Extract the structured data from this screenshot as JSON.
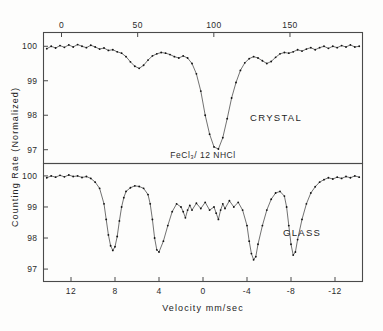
{
  "figure": {
    "ylabel": "Counting Rate (Normalized)",
    "xlabel_bottom": "Velocity  mm/sec",
    "center_annotation": "FeCl₃/ 12 NHCl",
    "ink_color": "#1a1a1a",
    "frame_color": "#4a4a4a",
    "background": "#fdfdfc"
  },
  "axes": {
    "top_channel_ticks": [
      "0",
      "50",
      "100",
      "150",
      "200"
    ],
    "top_channel_values": [
      0,
      50,
      100,
      150,
      200
    ],
    "bottom_velocity_ticks": [
      "12",
      "8",
      "4",
      "0",
      "-4",
      "-8",
      "-12"
    ],
    "bottom_velocity_values": [
      12,
      8,
      4,
      0,
      -4,
      -8,
      -12
    ],
    "y_ticks_upper": [
      "100",
      "99",
      "98",
      "97"
    ],
    "y_ticks_lower": [
      "100",
      "99",
      "98",
      "97"
    ],
    "y_values": [
      100,
      99,
      98,
      97
    ]
  },
  "panels": [
    {
      "id": "upper",
      "label": "CRYSTAL"
    },
    {
      "id": "lower",
      "label": "GLASS"
    }
  ],
  "chart_data": {
    "type": "line",
    "title": "FeCl₃/ 12 NHCl",
    "xlabel": "Velocity  mm/sec",
    "ylabel": "Counting Rate (Normalized)",
    "grid": false,
    "legend": "none",
    "top_axis_label": "Channel number",
    "top_axis_range": [
      0,
      200
    ],
    "xlim": [
      14.5,
      -14.5
    ],
    "ylim": [
      96.6,
      100.4
    ],
    "series": [
      {
        "name": "CRYSTAL",
        "panel": "upper",
        "absorption_minima_velocity": [
          5.6,
          2.4,
          0.0,
          -2.6,
          -5.8
        ],
        "deepest_minimum": {
          "velocity": 0.0,
          "counting_rate": 97.0
        },
        "x": [
          14.2,
          13.8,
          13.4,
          13.0,
          12.6,
          12.2,
          11.8,
          11.4,
          11.0,
          10.6,
          10.2,
          9.8,
          9.4,
          9.0,
          8.6,
          8.2,
          7.8,
          7.4,
          7.0,
          6.6,
          6.2,
          5.8,
          5.4,
          5.0,
          4.6,
          4.2,
          3.8,
          3.4,
          3.0,
          2.6,
          2.2,
          1.8,
          1.4,
          1.0,
          0.6,
          0.2,
          -0.2,
          -0.6,
          -1.0,
          -1.4,
          -1.8,
          -2.2,
          -2.6,
          -3.0,
          -3.4,
          -3.8,
          -4.2,
          -4.6,
          -5.0,
          -5.4,
          -5.8,
          -6.2,
          -6.6,
          -7.0,
          -7.4,
          -7.8,
          -8.2,
          -8.6,
          -9.0,
          -9.4,
          -9.8,
          -10.2,
          -10.6,
          -11.0,
          -11.4,
          -11.8,
          -12.2,
          -12.6,
          -13.0,
          -13.4,
          -13.8,
          -14.2
        ],
        "y": [
          99.93,
          100.0,
          99.95,
          100.02,
          99.97,
          100.04,
          99.98,
          100.05,
          100.0,
          99.96,
          100.03,
          99.98,
          99.92,
          99.95,
          99.88,
          99.9,
          99.84,
          99.8,
          99.7,
          99.55,
          99.42,
          99.36,
          99.45,
          99.6,
          99.72,
          99.78,
          99.82,
          99.8,
          99.76,
          99.7,
          99.66,
          99.72,
          99.66,
          99.5,
          99.2,
          98.7,
          98.0,
          97.45,
          97.08,
          97.02,
          97.35,
          97.9,
          98.5,
          98.95,
          99.3,
          99.52,
          99.64,
          99.7,
          99.66,
          99.58,
          99.5,
          99.56,
          99.68,
          99.78,
          99.82,
          99.8,
          99.84,
          99.9,
          99.86,
          99.92,
          99.96,
          99.9,
          99.96,
          100.0,
          99.94,
          100.0,
          99.96,
          100.02,
          99.98,
          100.04,
          99.98,
          100.0
        ]
      },
      {
        "name": "GLASS",
        "panel": "lower",
        "absorption_minima_velocity": [
          8.0,
          4.6,
          1.5,
          -1.5,
          -4.6,
          -8.0
        ],
        "deepest_minimum": {
          "velocity": -4.6,
          "counting_rate": 97.25
        },
        "x": [
          14.2,
          13.8,
          13.4,
          13.0,
          12.6,
          12.2,
          11.8,
          11.4,
          11.0,
          10.6,
          10.2,
          9.8,
          9.4,
          9.0,
          8.8,
          8.6,
          8.4,
          8.2,
          8.0,
          7.8,
          7.6,
          7.4,
          7.2,
          7.0,
          6.6,
          6.2,
          5.8,
          5.4,
          5.0,
          4.8,
          4.6,
          4.4,
          4.2,
          4.0,
          3.6,
          3.2,
          2.8,
          2.4,
          2.0,
          1.8,
          1.6,
          1.4,
          1.2,
          1.0,
          0.6,
          0.2,
          -0.2,
          -0.6,
          -1.0,
          -1.2,
          -1.4,
          -1.6,
          -1.8,
          -2.0,
          -2.4,
          -2.8,
          -3.2,
          -3.6,
          -4.0,
          -4.2,
          -4.4,
          -4.6,
          -4.8,
          -5.0,
          -5.4,
          -5.8,
          -6.2,
          -6.6,
          -7.0,
          -7.4,
          -7.6,
          -7.8,
          -8.0,
          -8.2,
          -8.4,
          -8.6,
          -9.0,
          -9.4,
          -9.8,
          -10.2,
          -10.6,
          -11.0,
          -11.4,
          -11.8,
          -12.2,
          -12.6,
          -13.0,
          -13.4,
          -13.8,
          -14.2
        ],
        "y": [
          99.94,
          100.0,
          99.96,
          100.02,
          99.97,
          100.03,
          99.98,
          100.0,
          99.95,
          99.98,
          99.92,
          99.8,
          99.6,
          99.1,
          98.6,
          98.1,
          97.75,
          97.6,
          97.72,
          98.05,
          98.55,
          99.0,
          99.3,
          99.5,
          99.62,
          99.68,
          99.66,
          99.6,
          99.4,
          99.1,
          98.6,
          98.0,
          97.62,
          97.55,
          97.9,
          98.4,
          98.85,
          99.1,
          99.0,
          98.85,
          98.65,
          98.9,
          99.05,
          98.9,
          99.12,
          98.95,
          99.15,
          98.9,
          99.0,
          98.8,
          98.6,
          98.9,
          99.1,
          98.95,
          99.2,
          99.0,
          99.15,
          98.9,
          98.4,
          97.9,
          97.5,
          97.3,
          97.4,
          97.8,
          98.4,
          98.9,
          99.25,
          99.45,
          99.5,
          99.35,
          99.0,
          98.4,
          97.8,
          97.45,
          97.55,
          97.95,
          98.6,
          99.1,
          99.45,
          99.65,
          99.8,
          99.88,
          99.94,
          99.9,
          99.96,
          99.92,
          99.98,
          99.94,
          100.0,
          99.96
        ]
      }
    ]
  }
}
